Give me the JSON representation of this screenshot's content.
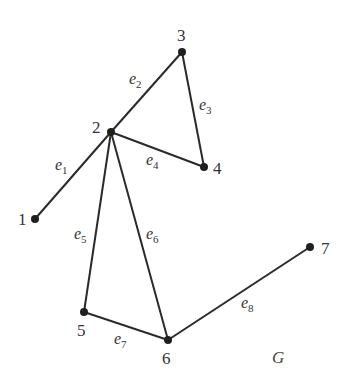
{
  "graph": {
    "name": "G",
    "vertices": [
      {
        "id": "1",
        "label": "1",
        "x": 35,
        "y": 219,
        "lx": 18,
        "ly": 225
      },
      {
        "id": "2",
        "label": "2",
        "x": 111,
        "y": 132,
        "lx": 92,
        "ly": 133
      },
      {
        "id": "3",
        "label": "3",
        "x": 182,
        "y": 52,
        "lx": 177,
        "ly": 41
      },
      {
        "id": "4",
        "label": "4",
        "x": 204,
        "y": 167,
        "lx": 213,
        "ly": 174
      },
      {
        "id": "5",
        "label": "5",
        "x": 84,
        "y": 312,
        "lx": 77,
        "ly": 336
      },
      {
        "id": "6",
        "label": "6",
        "x": 168,
        "y": 340,
        "lx": 162,
        "ly": 364
      },
      {
        "id": "7",
        "label": "7",
        "x": 310,
        "y": 247,
        "lx": 321,
        "ly": 254
      }
    ],
    "edges": [
      {
        "id": "e1",
        "name": "e",
        "sub": "1",
        "from": "2",
        "to": "1",
        "lx": 55,
        "ly": 170
      },
      {
        "id": "e2",
        "name": "e",
        "sub": "2",
        "from": "2",
        "to": "3",
        "lx": 129,
        "ly": 84
      },
      {
        "id": "e3",
        "name": "e",
        "sub": "3",
        "from": "3",
        "to": "4",
        "lx": 199,
        "ly": 110
      },
      {
        "id": "e4",
        "name": "e",
        "sub": "4",
        "from": "2",
        "to": "4",
        "lx": 146,
        "ly": 165
      },
      {
        "id": "e5",
        "name": "e",
        "sub": "5",
        "from": "2",
        "to": "5",
        "lx": 74,
        "ly": 239
      },
      {
        "id": "e6",
        "name": "e",
        "sub": "6",
        "from": "2",
        "to": "6",
        "lx": 146,
        "ly": 239
      },
      {
        "id": "e7",
        "name": "e",
        "sub": "7",
        "from": "5",
        "to": "6",
        "lx": 114,
        "ly": 344
      },
      {
        "id": "e8",
        "name": "e",
        "sub": "8",
        "from": "6",
        "to": "7",
        "lx": 241,
        "ly": 308
      }
    ],
    "graph_label": {
      "text": "G",
      "x": 272,
      "y": 363
    }
  }
}
